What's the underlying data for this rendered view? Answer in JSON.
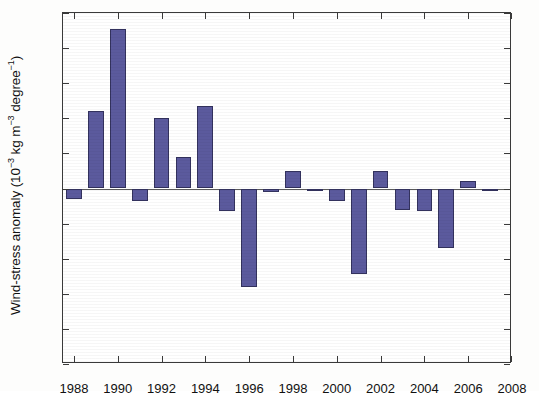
{
  "chart_data": {
    "type": "bar",
    "title": "",
    "subtitle": "",
    "xlabel": "",
    "ylabel": "Wind-stress anomaly (10⁻³ kg m⁻³ degree⁻¹)",
    "ylabel_parts": {
      "prefix": "Wind-stress anomaly (10",
      "exp1": "−3",
      "mid": " kg m",
      "exp2": "−3",
      "mid2": " degree",
      "exp3": "−1",
      "suffix": ")"
    },
    "xlim": [
      1987.5,
      2008.0
    ],
    "ylim": [
      -1,
      1
    ],
    "ytick_values": [
      1,
      0.8,
      0.6,
      0.4,
      0.2,
      0,
      -0.2,
      -0.4,
      -0.6,
      -0.8,
      -1
    ],
    "ytick_labels": [
      "1",
      "0.8",
      "0.6",
      "0.4",
      "0.2",
      "0",
      "-0.2",
      "-0.4",
      "-0.6",
      "-0.8",
      "-1"
    ],
    "xtick_values": [
      1988,
      1990,
      1992,
      1994,
      1996,
      1998,
      2000,
      2002,
      2004,
      2006,
      2008
    ],
    "xtick_labels": [
      "1988",
      "1990",
      "1992",
      "1994",
      "1996",
      "1998",
      "2000",
      "2002",
      "2004",
      "2006",
      "2008"
    ],
    "grid": false,
    "legend": null,
    "bar_color": "#5b5a9d",
    "bar_edge_color": "#33325e",
    "axis_color": "#3a3a3a",
    "categories": [
      1988,
      1989,
      1990,
      1991,
      1992,
      1993,
      1994,
      1995,
      1996,
      1997,
      1998,
      1999,
      2000,
      2001,
      2002,
      2003,
      2004,
      2005,
      2006,
      2007
    ],
    "values": [
      -0.06,
      0.44,
      0.91,
      -0.07,
      0.4,
      0.18,
      0.47,
      -0.13,
      -0.56,
      -0.02,
      0.1,
      -0.01,
      -0.07,
      -0.49,
      0.1,
      -0.12,
      -0.13,
      -0.34,
      0.04,
      -0.01
    ]
  }
}
